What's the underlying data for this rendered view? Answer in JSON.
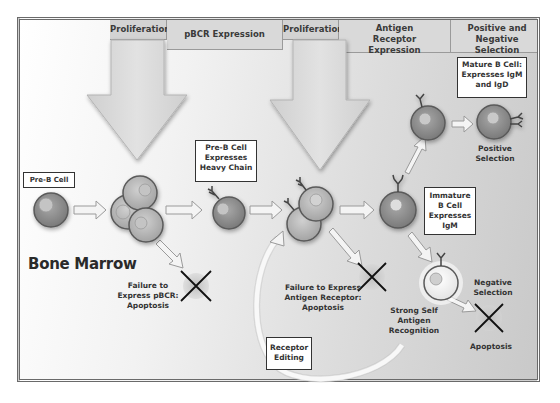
{
  "diagram": {
    "region_label": "Bone Marrow",
    "stage_headers": [
      {
        "label": "Proliferation"
      },
      {
        "label": "pBCR Expression"
      },
      {
        "label": "Proliferation"
      },
      {
        "label": "Antigen Receptor Expression"
      },
      {
        "label": "Positive and Negative Selection"
      }
    ],
    "cell_labels": {
      "pre_b_cell": "Pre-B Cell",
      "pre_b_heavy_chain": "Pre-B Cell Expresses Heavy Chain",
      "immature_b_cell": "Immature B Cell Expresses IgM",
      "mature_b_cell": "Mature B Cell: Expresses IgM and IgD",
      "receptor_editing": "Receptor Editing"
    },
    "annotations": {
      "failure_pbcr": [
        "Failure to",
        "Express pBCR:",
        "Apoptosis"
      ],
      "failure_antigen_receptor": [
        "Failure to Express",
        "Antigen Receptor:",
        "Apoptosis"
      ],
      "strong_self_antigen": [
        "Strong Self",
        "Antigen",
        "Recognition"
      ],
      "positive_selection": [
        "Positive",
        "Selection"
      ],
      "negative_selection": [
        "Negative",
        "Selection"
      ],
      "apoptosis": "Apoptosis"
    },
    "colors": {
      "cell_fill": "#8e8e8e",
      "cell_border": "#555555",
      "nucleus": "#b8b8b8",
      "arrow_fill": "#f4f4f4",
      "arrow_stroke": "#9a9a9a",
      "header_fill": "#d9d9d9",
      "text": "#333333"
    }
  }
}
